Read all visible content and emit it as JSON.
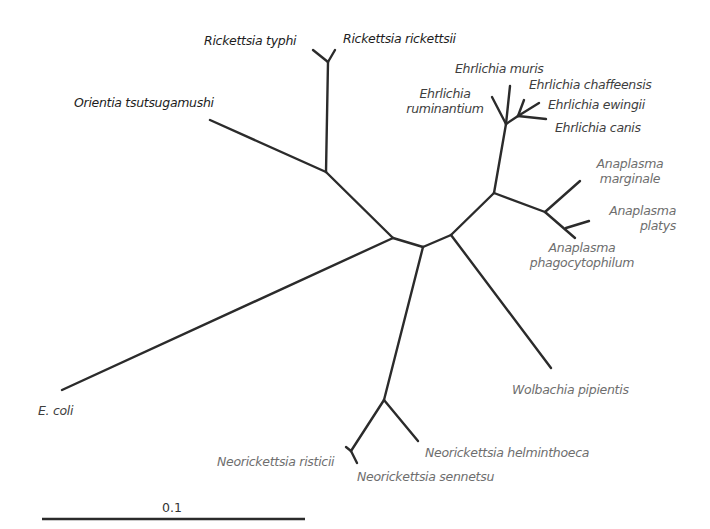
{
  "diagram": {
    "type": "unrooted phylogenetic tree",
    "scale_bar": {
      "label": "0.1"
    },
    "taxa": {
      "rickettsia_typhi": "Rickettsia typhi",
      "rickettsia_rickettsii": "Rickettsia rickettsii",
      "orientia": "Orientia tsutsugamushi",
      "e_coli": "E. coli",
      "ehrlichia_muris": "Ehrlichia muris",
      "ehrlichia_ruminantium_1": "Ehrlichia",
      "ehrlichia_ruminantium_2": "ruminantium",
      "ehrlichia_chaffeensis": "Ehrlichia chaffeensis",
      "ehrlichia_ewingii": "Ehrlichia ewingii",
      "ehrlichia_canis": "Ehrlichia canis",
      "anaplasma_marginale_1": "Anaplasma",
      "anaplasma_marginale_2": "marginale",
      "anaplasma_platys_1": "Anaplasma",
      "anaplasma_platys_2": "platys",
      "anaplasma_phago_1": "Anaplasma",
      "anaplasma_phago_2": "phagocytophilum",
      "wolbachia": "Wolbachia pipientis",
      "neorickettsia_ristici": "Neorickettsia risticii",
      "neorickettsia_helminthoeca": "Neorickettsia helminthoeca",
      "neorickettsia_sennetsu": "Neorickettsia sennetsu"
    },
    "colors": {
      "branch": "#2b2b2b",
      "rickettsiaceae_labels": "#1d1d1d",
      "ehrlichia_labels": "#3e3e3e",
      "other_labels": "#6e6e6e"
    }
  }
}
